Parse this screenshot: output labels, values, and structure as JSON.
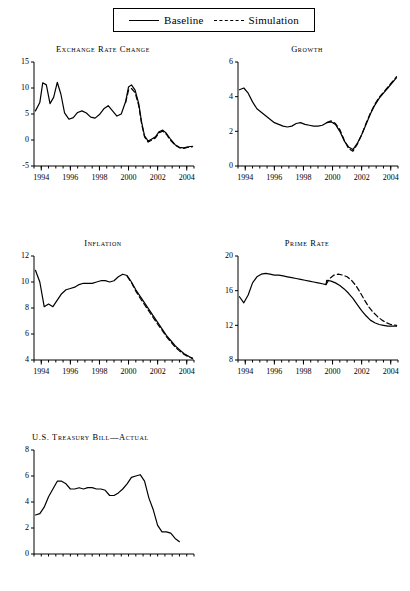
{
  "legend": {
    "entries": [
      {
        "label": "Baseline",
        "style": "solid"
      },
      {
        "label": "Simulation",
        "style": "dashed"
      }
    ]
  },
  "chart_data": [
    {
      "type": "line",
      "title": "Exchange Rate Change",
      "xlabel": "",
      "ylabel": "",
      "xlim": [
        1993.5,
        2004.5
      ],
      "ylim": [
        -5,
        15
      ],
      "yticks": [
        -5,
        0,
        5,
        10,
        15
      ],
      "xticks": [
        1994,
        1996,
        1998,
        2000,
        2002,
        2004
      ],
      "grid": false,
      "series": [
        {
          "name": "Baseline",
          "style": "solid",
          "x": [
            1993.6,
            1993.9,
            1994.1,
            1994.35,
            1994.6,
            1994.85,
            1995.1,
            1995.35,
            1995.6,
            1995.9,
            1996.2,
            1996.5,
            1996.8,
            1997.1,
            1997.4,
            1997.7,
            1998.0,
            1998.3,
            1998.6,
            1998.9,
            1999.2,
            1999.5,
            1999.8,
            2000.0,
            2000.2,
            2000.45,
            2000.7,
            2000.9,
            2001.1,
            2001.35,
            2001.6,
            2001.85,
            2002.1,
            2002.35,
            2002.6,
            2002.9,
            2003.2,
            2003.5,
            2003.8,
            2004.1,
            2004.4
          ],
          "y": [
            5.6,
            7.2,
            11.0,
            10.6,
            7.0,
            8.2,
            11.1,
            8.8,
            5.2,
            4.0,
            4.3,
            5.3,
            5.6,
            5.2,
            4.4,
            4.2,
            4.9,
            6.0,
            6.6,
            5.6,
            4.6,
            5.0,
            7.4,
            10.2,
            10.6,
            9.6,
            7.0,
            3.4,
            0.8,
            -0.2,
            0.2,
            0.6,
            1.6,
            1.9,
            1.3,
            0.1,
            -0.9,
            -1.4,
            -1.5,
            -1.3,
            -1.2
          ]
        },
        {
          "name": "Simulation",
          "style": "dashed",
          "x": [
            1999.8,
            2000.0,
            2000.2,
            2000.45,
            2000.7,
            2000.9,
            2001.1,
            2001.35,
            2001.6,
            2001.85,
            2002.1,
            2002.35,
            2002.6,
            2002.9,
            2003.2,
            2003.5,
            2003.8,
            2004.1,
            2004.4
          ],
          "y": [
            7.2,
            9.6,
            9.9,
            9.1,
            6.6,
            3.1,
            0.6,
            -0.4,
            0.0,
            0.4,
            1.4,
            1.7,
            1.1,
            -0.1,
            -1.0,
            -1.5,
            -1.6,
            -1.4,
            -1.3
          ]
        }
      ]
    },
    {
      "type": "line",
      "title": "Growth",
      "xlabel": "",
      "ylabel": "",
      "xlim": [
        1993.5,
        2004.5
      ],
      "ylim": [
        0,
        6
      ],
      "yticks": [
        0,
        2,
        4,
        6
      ],
      "xticks": [
        1994,
        1996,
        1998,
        2000,
        2002,
        2004
      ],
      "grid": false,
      "series": [
        {
          "name": "Baseline",
          "style": "solid",
          "x": [
            1993.6,
            1993.9,
            1994.2,
            1994.5,
            1994.8,
            1995.1,
            1995.4,
            1995.7,
            1996.0,
            1996.3,
            1996.6,
            1996.9,
            1997.2,
            1997.5,
            1997.8,
            1998.1,
            1998.4,
            1998.7,
            1999.0,
            1999.3,
            1999.6,
            1999.9,
            2000.2,
            2000.5,
            2000.8,
            2001.1,
            2001.4,
            2001.7,
            2002.0,
            2002.3,
            2002.6,
            2002.9,
            2003.2,
            2003.5,
            2003.8,
            2004.1,
            2004.4
          ],
          "y": [
            4.4,
            4.5,
            4.2,
            3.7,
            3.3,
            3.1,
            2.9,
            2.7,
            2.5,
            2.4,
            2.3,
            2.25,
            2.3,
            2.45,
            2.5,
            2.4,
            2.35,
            2.3,
            2.3,
            2.35,
            2.5,
            2.55,
            2.4,
            2.0,
            1.45,
            1.1,
            0.95,
            1.3,
            1.8,
            2.4,
            3.0,
            3.5,
            3.9,
            4.2,
            4.5,
            4.8,
            5.1
          ]
        },
        {
          "name": "Simulation",
          "style": "dashed",
          "x": [
            1999.6,
            1999.9,
            2000.2,
            2000.5,
            2000.8,
            2001.1,
            2001.4,
            2001.7,
            2002.0,
            2002.3,
            2002.6,
            2002.9,
            3203.2,
            2003.5,
            2003.8,
            2004.1,
            2004.4
          ],
          "y": [
            2.5,
            2.6,
            2.45,
            2.1,
            1.5,
            1.0,
            0.85,
            1.25,
            1.8,
            2.45,
            3.05,
            3.55,
            3.95,
            4.25,
            4.55,
            4.85,
            5.15
          ]
        }
      ]
    },
    {
      "type": "line",
      "title": "Inflation",
      "xlabel": "",
      "ylabel": "",
      "xlim": [
        1993.5,
        2004.5
      ],
      "ylim": [
        4,
        12
      ],
      "yticks": [
        4,
        6,
        8,
        10,
        12
      ],
      "xticks": [
        1994,
        1996,
        1998,
        2000,
        2002,
        2004
      ],
      "grid": false,
      "series": [
        {
          "name": "Baseline",
          "style": "solid",
          "x": [
            1993.6,
            1993.9,
            1994.2,
            1994.5,
            1994.8,
            1995.1,
            1995.4,
            1995.7,
            1996.0,
            1996.3,
            1996.6,
            1996.9,
            1997.2,
            1997.5,
            1997.8,
            1998.1,
            1998.4,
            1998.7,
            1999.0,
            1999.3,
            1999.6,
            1999.9,
            2000.2,
            2000.5,
            2000.8,
            2001.1,
            2001.4,
            2001.7,
            2002.0,
            2002.3,
            2002.6,
            2002.9,
            2003.2,
            2003.5,
            2003.8,
            2004.1,
            2004.4
          ],
          "y": [
            10.9,
            10.0,
            8.1,
            8.3,
            8.1,
            8.6,
            9.1,
            9.4,
            9.5,
            9.6,
            9.8,
            9.9,
            9.9,
            9.9,
            10.0,
            10.1,
            10.1,
            10.0,
            10.1,
            10.4,
            10.6,
            10.5,
            10.0,
            9.4,
            8.9,
            8.4,
            7.9,
            7.4,
            6.9,
            6.4,
            5.9,
            5.5,
            5.1,
            4.8,
            4.5,
            4.3,
            4.1
          ]
        },
        {
          "name": "Simulation",
          "style": "dashed",
          "x": [
            1999.9,
            2000.2,
            2000.5,
            2000.8,
            2001.1,
            2001.4,
            2001.7,
            2002.0,
            2002.3,
            2002.6,
            2002.9,
            2003.2,
            2003.5,
            2003.8,
            2004.1,
            2004.4
          ],
          "y": [
            10.45,
            9.95,
            9.3,
            8.75,
            8.25,
            7.75,
            7.25,
            6.75,
            6.3,
            5.8,
            5.4,
            5.0,
            4.7,
            4.45,
            4.25,
            4.15
          ]
        }
      ]
    },
    {
      "type": "line",
      "title": "Prime Rate",
      "xlabel": "",
      "ylabel": "",
      "xlim": [
        1993.5,
        2004.5
      ],
      "ylim": [
        8,
        20
      ],
      "yticks": [
        8,
        12,
        16,
        20
      ],
      "xticks": [
        1994,
        1996,
        1998,
        2000,
        2002,
        2004
      ],
      "grid": false,
      "series": [
        {
          "name": "Baseline",
          "style": "solid",
          "x": [
            1993.6,
            1993.9,
            1994.2,
            1994.5,
            1994.8,
            1995.1,
            1995.4,
            1995.7,
            1996.0,
            1996.3,
            1996.6,
            1996.9,
            1997.2,
            1997.5,
            1997.8,
            1998.1,
            1998.4,
            1998.7,
            1999.0,
            1999.3,
            1999.55,
            1999.6,
            1999.9,
            2000.2,
            2000.5,
            2000.8,
            2001.1,
            2001.4,
            2001.7,
            2002.0,
            2002.3,
            2002.6,
            2002.9,
            2003.2,
            2003.5,
            2003.8,
            2004.1,
            2004.4
          ],
          "y": [
            15.3,
            14.6,
            15.5,
            16.9,
            17.6,
            17.9,
            18.0,
            17.9,
            17.8,
            17.8,
            17.7,
            17.6,
            17.5,
            17.4,
            17.3,
            17.2,
            17.1,
            17.0,
            16.9,
            16.8,
            16.7,
            17.2,
            17.1,
            16.9,
            16.6,
            16.2,
            15.7,
            15.1,
            14.4,
            13.7,
            13.1,
            12.6,
            12.3,
            12.1,
            12.0,
            11.9,
            11.9,
            11.9
          ]
        },
        {
          "name": "Simulation",
          "style": "dashed",
          "x": [
            1999.55,
            1999.8,
            2000.1,
            2000.4,
            2000.7,
            2001.0,
            2001.3,
            2001.6,
            2001.9,
            2002.2,
            2002.5,
            2002.8,
            2003.1,
            2003.4,
            2003.7,
            2004.0,
            2004.4
          ],
          "y": [
            16.7,
            17.4,
            17.8,
            17.9,
            17.8,
            17.6,
            17.2,
            16.6,
            15.8,
            14.9,
            14.1,
            13.5,
            13.0,
            12.6,
            12.3,
            12.1,
            12.0
          ]
        }
      ]
    },
    {
      "type": "line",
      "title": "U.S. Treasury Bill—Actual",
      "xlabel": "",
      "ylabel": "",
      "xlim": [
        1993.5,
        2004.5
      ],
      "ylim": [
        0,
        8
      ],
      "yticks": [
        0,
        2,
        4,
        6,
        8
      ],
      "xticks": [],
      "grid": false,
      "series": [
        {
          "name": "Actual",
          "style": "solid",
          "x": [
            1993.6,
            1993.9,
            1994.2,
            1994.5,
            1994.8,
            1995.1,
            1995.4,
            1995.7,
            1996.0,
            1996.3,
            1996.6,
            1996.9,
            1997.2,
            1997.5,
            1997.8,
            1998.1,
            1998.4,
            1998.7,
            1999.0,
            1999.3,
            1999.6,
            1999.9,
            2000.2,
            2000.5,
            2000.8,
            2001.1,
            2001.4,
            2001.7,
            2002.0,
            2002.3,
            2002.6,
            2002.9,
            2003.2,
            2003.5
          ],
          "y": [
            3.0,
            3.1,
            3.6,
            4.4,
            5.0,
            5.6,
            5.6,
            5.4,
            5.0,
            5.0,
            5.1,
            5.0,
            5.1,
            5.1,
            5.0,
            5.0,
            4.9,
            4.5,
            4.5,
            4.7,
            5.0,
            5.4,
            5.9,
            6.0,
            6.1,
            5.6,
            4.3,
            3.4,
            2.2,
            1.7,
            1.7,
            1.6,
            1.2,
            0.95
          ]
        }
      ]
    }
  ]
}
